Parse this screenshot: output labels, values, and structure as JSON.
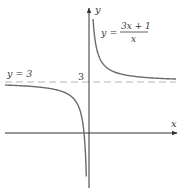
{
  "figure": {
    "function_label": {
      "lhs": "y =",
      "numerator": "3x + 1",
      "denominator": "x"
    },
    "asymptote_label": "y = 3",
    "tick_label_y": "3",
    "x_axis_label": "x",
    "y_axis_label": "y",
    "colors": {
      "axis": "#333333",
      "curve": "#6b6b6b",
      "asymptote": "#b5b5b5",
      "text": "#3a3a3a"
    }
  },
  "chart_data": {
    "type": "line",
    "title": "",
    "function": "y = (3x + 1)/x",
    "xlabel": "x",
    "ylabel": "y",
    "horizontal_asymptote": {
      "y": 3,
      "label": "y = 3",
      "style": "dashed"
    },
    "vertical_asymptote": {
      "x": 0
    },
    "x_intercept": -0.3333,
    "y_ticks": [
      3
    ],
    "grid": false,
    "series": [
      {
        "name": "right branch",
        "x": [
          0.27,
          0.35,
          0.5,
          0.75,
          1,
          1.5,
          2,
          3,
          4,
          5,
          5.8
        ],
        "y": [
          6.7,
          5.86,
          5,
          4.33,
          4,
          3.67,
          3.5,
          3.33,
          3.25,
          3.2,
          3.17
        ]
      },
      {
        "name": "left branch",
        "x": [
          -5.6,
          -4,
          -3,
          -2,
          -1.5,
          -1,
          -0.75,
          -0.5,
          -0.35,
          -0.25,
          -0.2,
          -0.18
        ],
        "y": [
          2.82,
          2.75,
          2.67,
          2.5,
          2.33,
          2,
          1.67,
          1,
          0.14,
          -1,
          -2,
          -2.5
        ]
      }
    ]
  }
}
